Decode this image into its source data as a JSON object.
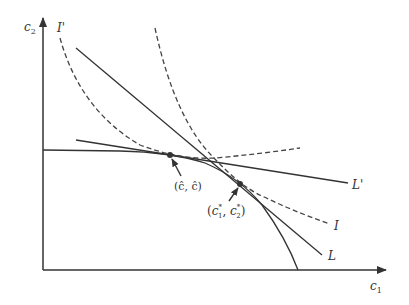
{
  "diagram": {
    "axes": {
      "x_label": "c",
      "x_sub": "1",
      "y_label": "c",
      "y_sub": "2"
    },
    "curves": {
      "frontier": "production-possibility frontier",
      "indiff_I": "I",
      "indiff_I_prime": "I'",
      "line_L": "L",
      "line_L_prime": "L'"
    },
    "points": {
      "golden_rule": {
        "label": "(ĉ, ĉ)"
      },
      "optimum": {
        "label_open": "(",
        "c1": "c",
        "c1_sub": "1",
        "c1_sup": "*",
        "sep": ", ",
        "c2": "c",
        "c2_sub": "2",
        "c2_sup": "*",
        "label_close": ")"
      }
    },
    "colors": {
      "line": "#333333",
      "dashed": "#444444"
    }
  }
}
